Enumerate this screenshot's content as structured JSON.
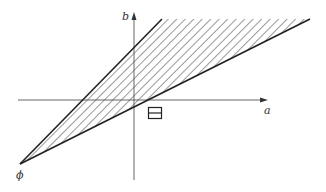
{
  "diagram": {
    "type": "cone-region",
    "axes": {
      "horizontal_label": "a",
      "vertical_label": "b"
    },
    "apex_label": "ϕ",
    "region": "shaded cone between two rays from apex",
    "marker": "boxed-equals-symbol",
    "colors": {
      "line": "#222222",
      "axis": "#555555",
      "hatch": "#333333",
      "background": "#ffffff"
    }
  }
}
